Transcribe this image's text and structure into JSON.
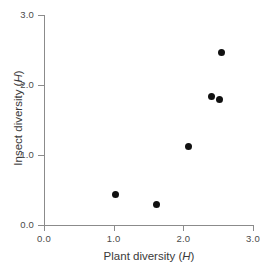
{
  "chart_data": {
    "type": "scatter",
    "title": "",
    "subtitle": "",
    "xlabel_prefix": "Plant diversity (",
    "xlabel_symbol": "H",
    "xlabel_suffix": ")",
    "ylabel_prefix": "Insect diversity (",
    "ylabel_symbol": "H",
    "ylabel_suffix": ")",
    "xlim": [
      0.0,
      3.0
    ],
    "ylim": [
      0.0,
      3.0
    ],
    "grid": false,
    "legend": false,
    "legend_position": "none",
    "marker": "filled-circle",
    "marker_color": "#111111",
    "axis_color": "#8b8b8b",
    "background_color": "#ffffff",
    "xticks": [
      "0.0",
      "1.0",
      "2.0",
      "3.0"
    ],
    "xtick_values": [
      0.0,
      1.0,
      2.0,
      3.0
    ],
    "yticks": [
      "0.0",
      "1.0",
      "2.0",
      "3.0"
    ],
    "ytick_values": [
      0.0,
      1.0,
      2.0,
      3.0
    ],
    "points": [
      {
        "x": 1.03,
        "y": 0.44
      },
      {
        "x": 1.61,
        "y": 0.3
      },
      {
        "x": 2.08,
        "y": 1.12
      },
      {
        "x": 2.41,
        "y": 1.83
      },
      {
        "x": 2.52,
        "y": 1.8
      },
      {
        "x": 2.55,
        "y": 2.47
      }
    ]
  }
}
